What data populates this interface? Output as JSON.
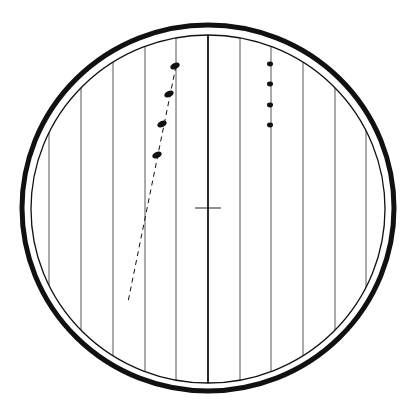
{
  "diagram": {
    "colors": {
      "ink": "#111111",
      "background": "#ffffff",
      "ruling": "#555555"
    },
    "outer_ring": {
      "cx": 208,
      "cy": 208,
      "rx": 186,
      "ry": 183,
      "stroke_width": 5
    },
    "inner_ring": {
      "cx": 208,
      "cy": 209,
      "rx": 177,
      "ry": 174,
      "stroke_width": 1.3
    },
    "ruling_lines_x": [
      49,
      81,
      113,
      145,
      176,
      240,
      271,
      303,
      335,
      366
    ],
    "center_line_x": 208,
    "crosshair": {
      "x": 208,
      "y": 208,
      "half_width": 13
    },
    "dashed_trajectory": {
      "x1": 176,
      "y1": 66,
      "x2": 128,
      "y2": 302
    },
    "left_dots": [
      {
        "x": 175,
        "y": 66,
        "rx": 5,
        "ry": 3,
        "rotate": -25
      },
      {
        "x": 169,
        "y": 94,
        "rx": 5,
        "ry": 3,
        "rotate": -25
      },
      {
        "x": 162,
        "y": 124,
        "rx": 5,
        "ry": 3,
        "rotate": -25
      },
      {
        "x": 157,
        "y": 155,
        "rx": 5,
        "ry": 3,
        "rotate": -25
      }
    ],
    "right_dots": [
      {
        "x": 270,
        "y": 64,
        "r": 2.4
      },
      {
        "x": 270,
        "y": 84,
        "r": 2.4
      },
      {
        "x": 270,
        "y": 105,
        "r": 2.4
      },
      {
        "x": 270,
        "y": 125,
        "r": 2.4
      }
    ]
  }
}
